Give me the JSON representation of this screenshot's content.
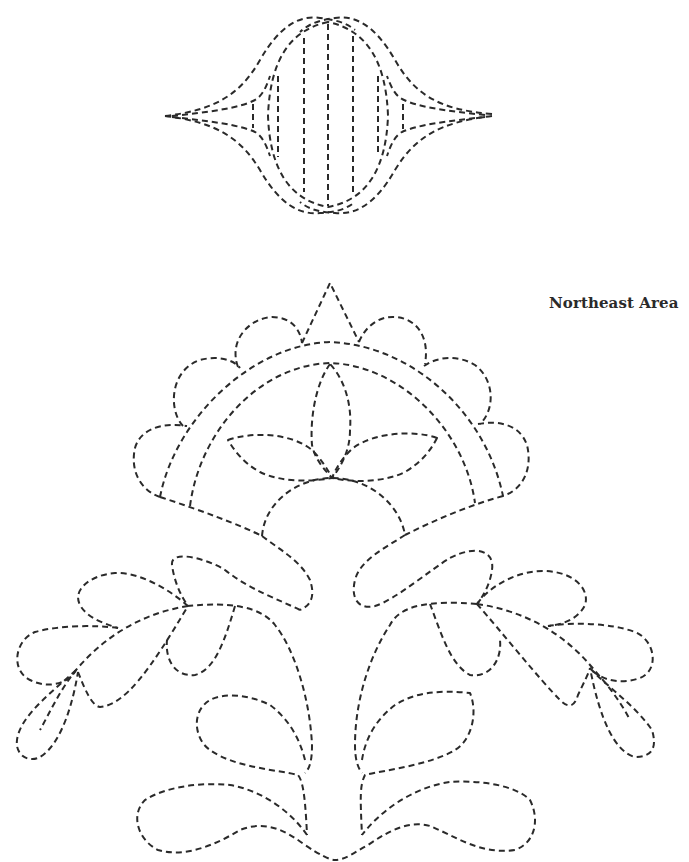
{
  "title_label": "Northeast Area",
  "diagram": {
    "type": "quilting stitch pattern",
    "line_style": "dashed",
    "stroke_color": "#2a2a2a",
    "background_color": "#ffffff",
    "motifs": [
      {
        "name": "tulip-bud-border-motif",
        "position": "top-center",
        "description": "Lens-shaped bud with vertical channel lines and pointed side tips"
      },
      {
        "name": "crown-arch-motif",
        "position": "middle-center",
        "description": "Scalloped double arch with center triangle and three-petal flower over a half-circle"
      },
      {
        "name": "left-feather-spray",
        "position": "bottom-left",
        "description": "Curved stem with teardrop leaves"
      },
      {
        "name": "right-feather-spray",
        "position": "bottom-right",
        "description": "Curved stem with teardrop leaves"
      },
      {
        "name": "base-scroll-motif",
        "position": "bottom-center",
        "description": "Paired paisley scrolls joined at the base"
      }
    ]
  }
}
